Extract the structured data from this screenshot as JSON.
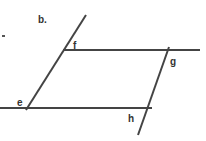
{
  "figure": {
    "part_label": "b.",
    "points": {
      "e": "e",
      "f": "f",
      "g": "g",
      "h": "h"
    },
    "line_color": "#444444"
  }
}
